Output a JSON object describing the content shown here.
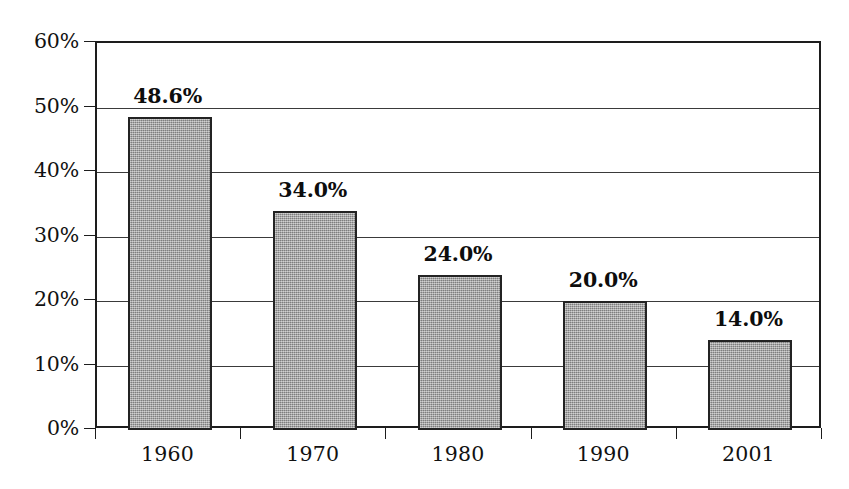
{
  "chart_data": {
    "type": "bar",
    "title": "",
    "subtitle": "",
    "xlabel": "",
    "ylabel": "",
    "categories": [
      "1960",
      "1970",
      "1980",
      "1990",
      "2001"
    ],
    "values": [
      48.6,
      34.0,
      24.0,
      20.0,
      14.0
    ],
    "data_labels": [
      "48.6%",
      "34.0%",
      "24.0%",
      "20.0%",
      "14.0%"
    ],
    "ylim": [
      0,
      60
    ],
    "y_ticks": [
      0,
      10,
      20,
      30,
      40,
      50,
      60
    ],
    "y_tick_labels": [
      "0%",
      "10%",
      "20%",
      "30%",
      "40%",
      "50%",
      "60%"
    ],
    "grid": "horizontal",
    "legend": "none",
    "bar_fill_color": "#9a9a9a",
    "bar_border_color": "#232323",
    "axis_color": "#1d1d1d",
    "gridline_color": "#3a3a3a",
    "background_color": "#ffffff",
    "text_color": "#111111"
  }
}
